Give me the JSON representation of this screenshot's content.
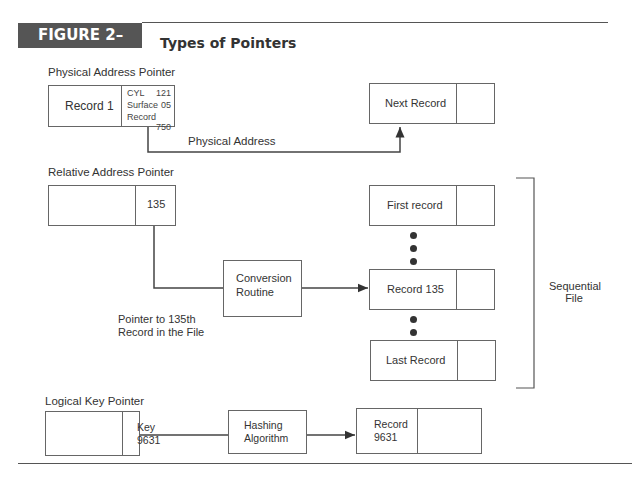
{
  "figure": {
    "number": "FIGURE 2–42",
    "title": "Types of Pointers"
  },
  "physical": {
    "section_label": "Physical Address Pointer",
    "record_label": "Record 1",
    "fields": [
      {
        "name": "CYL",
        "value": "121"
      },
      {
        "name": "Surface",
        "value": "05"
      },
      {
        "name": "Record",
        "value": "750"
      }
    ],
    "target_label": "Next Record",
    "connector_label": "Physical Address"
  },
  "relative": {
    "section_label": "Relative Address Pointer",
    "pointer_value": "135",
    "conversion_line1": "Conversion",
    "conversion_line2": "Routine",
    "caption_line1": "Pointer to 135th",
    "caption_line2": "Record in the File",
    "records": [
      "First record",
      "Record 135",
      "Last Record"
    ],
    "bracket_label_line1": "Sequential",
    "bracket_label_line2": "File"
  },
  "logical": {
    "section_label": "Logical Key Pointer",
    "key_line1": "Key",
    "key_line2": "9631",
    "hash_line1": "Hashing",
    "hash_line2": "Algorithm",
    "record_line1": "Record",
    "record_line2": "9631"
  },
  "colors": {
    "badge_bg": "#555555",
    "line": "#444444",
    "text": "#333333"
  }
}
